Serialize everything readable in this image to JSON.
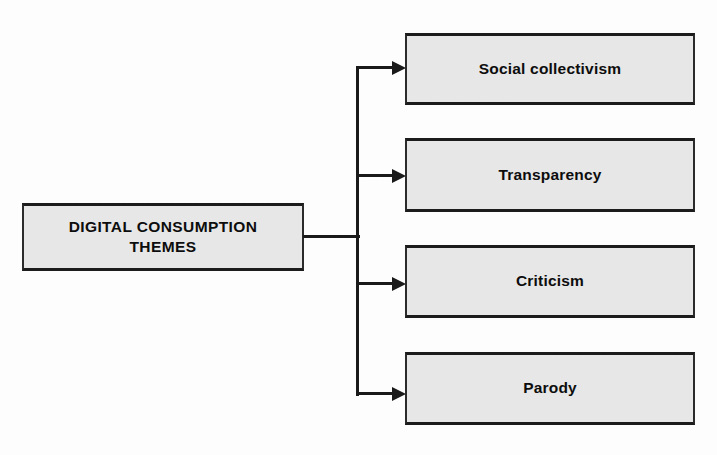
{
  "diagram": {
    "type": "horizontal-tree",
    "root": {
      "label": "DIGITAL CONSUMPTION\nTHEMES"
    },
    "branches": [
      {
        "label": "Social collectivism"
      },
      {
        "label": "Transparency"
      },
      {
        "label": "Criticism"
      },
      {
        "label": "Parody"
      }
    ],
    "colors": {
      "box_fill": "#e9e9e9",
      "box_border": "#1c1c1c",
      "connector": "#1a1a1a",
      "text": "#0d0d0d",
      "background": "#ffffff"
    }
  }
}
